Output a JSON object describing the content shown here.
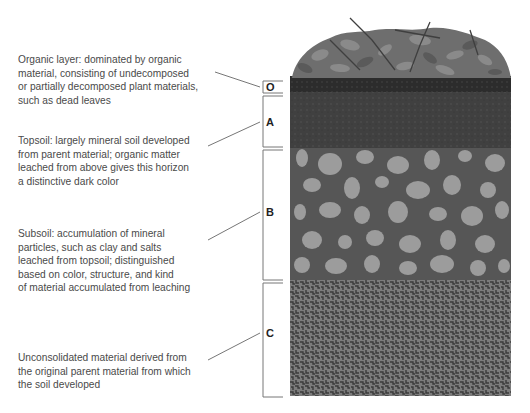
{
  "figure": {
    "type": "soil-profile",
    "horizons": [
      {
        "label": "O",
        "name": "Organic layer",
        "description_lines": [
          "Organic layer:  dominated by organic",
          "material, consisting of undecomposed",
          "or partially decomposed plant materials,",
          "such as dead leaves"
        ]
      },
      {
        "label": "A",
        "name": "Topsoil",
        "description_lines": [
          "Topsoil:  largely mineral soil developed",
          "from parent material; organic matter",
          "leached from above gives this horizon",
          "a distinctive dark color"
        ]
      },
      {
        "label": "B",
        "name": "Subsoil",
        "description_lines": [
          "Subsoil:  accumulation of mineral",
          "particles, such as clay and salts",
          "leached from topsoil; distinguished",
          "based on color, structure, and kind",
          "of material accumulated from leaching"
        ]
      },
      {
        "label": "C",
        "name": "Unconsolidated material",
        "description_lines": [
          "Unconsolidated material derived from",
          "the original parent material from which",
          "the soil developed"
        ]
      }
    ],
    "colors": {
      "leaf_litter": "#6e6e6e",
      "o_layer": "#2e2e2e",
      "a_layer": "#3f3f3f",
      "b_layer_matrix": "#555555",
      "b_layer_stones": "#9a9a9a",
      "c_layer_matrix": "#7a7a7a",
      "c_layer_speckle": "#3a3a3a",
      "text": "#4a4a4a",
      "lines": "#666666"
    }
  }
}
